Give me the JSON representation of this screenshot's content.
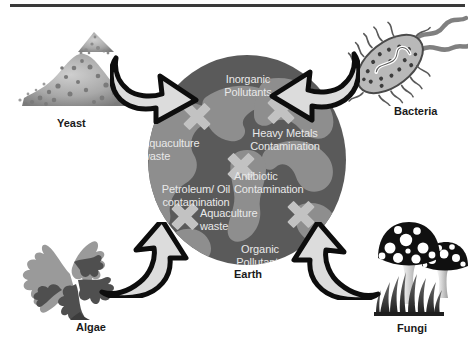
{
  "figure": {
    "center_caption": "Earth",
    "accent_colors": {
      "ocean": "#5a5a5a",
      "land": "#8e8e8e",
      "x_mark": "#c2c2c2",
      "arrow_fill": "#d8d8d8",
      "arrow_outline": "#0d0d0d",
      "text_on_globe": "#e9e9e9",
      "caption_text": "#1a1a1a",
      "rule": "#3a3a3a",
      "background": "#ffffff"
    }
  },
  "globe": {
    "labels": [
      {
        "id": "inorganic-pollutants",
        "text": "Inorganic\nPollutants",
        "left": 57,
        "top": 18,
        "width": 86
      },
      {
        "id": "heavy-metals",
        "text": "Heavy Metals\nContamination",
        "left": 83,
        "top": 72,
        "width": 108
      },
      {
        "id": "aquaculture-waste-upper",
        "text": "Aquaculture\nwaste",
        "left": -6,
        "top": 82,
        "width": 88
      },
      {
        "id": "antibiotic",
        "text": "Antibiotic\nContamination",
        "left": 86,
        "top": 115,
        "width": 100
      },
      {
        "id": "petroleum-oil",
        "text": "Petroleum/ Oil\ncontamination",
        "left": -2,
        "top": 128,
        "width": 100
      },
      {
        "id": "aquaculture-waste-lower",
        "text": "Aquaculture\nwaste",
        "left": 52,
        "top": 152,
        "width": 88
      },
      {
        "id": "organic-pollutants",
        "text": "Organic\nPollutants",
        "left": 72,
        "top": 188,
        "width": 80
      }
    ],
    "x_marks": [
      {
        "id": "x-northwest",
        "left": 34,
        "top": 46
      },
      {
        "id": "x-northeast",
        "left": 118,
        "top": 40
      },
      {
        "id": "x-center",
        "left": 78,
        "top": 96
      },
      {
        "id": "x-southwest",
        "left": 22,
        "top": 146
      },
      {
        "id": "x-southeast",
        "left": 138,
        "top": 144
      }
    ]
  },
  "organisms": [
    {
      "id": "yeast",
      "label": "Yeast",
      "icon": "yeast-granules-icon"
    },
    {
      "id": "bacteria",
      "label": "Bacteria",
      "icon": "bacterium-rod-flagella-icon"
    },
    {
      "id": "algae",
      "label": "Algae",
      "icon": "branching-seaweed-icon"
    },
    {
      "id": "fungi",
      "label": "Fungi",
      "icon": "spotted-mushrooms-grass-icon"
    }
  ],
  "arrows": [
    {
      "id": "arrow-yeast-earth",
      "from": "Yeast",
      "to": "Earth",
      "icon": "curved-block-arrow-down-right-icon"
    },
    {
      "id": "arrow-bacteria-earth",
      "from": "Bacteria",
      "to": "Earth",
      "icon": "curved-block-arrow-down-left-icon"
    },
    {
      "id": "arrow-algae-earth",
      "from": "Algae",
      "to": "Earth",
      "icon": "curved-block-arrow-up-right-icon"
    },
    {
      "id": "arrow-fungi-earth",
      "from": "Fungi",
      "to": "Earth",
      "icon": "curved-block-arrow-up-left-icon"
    }
  ]
}
